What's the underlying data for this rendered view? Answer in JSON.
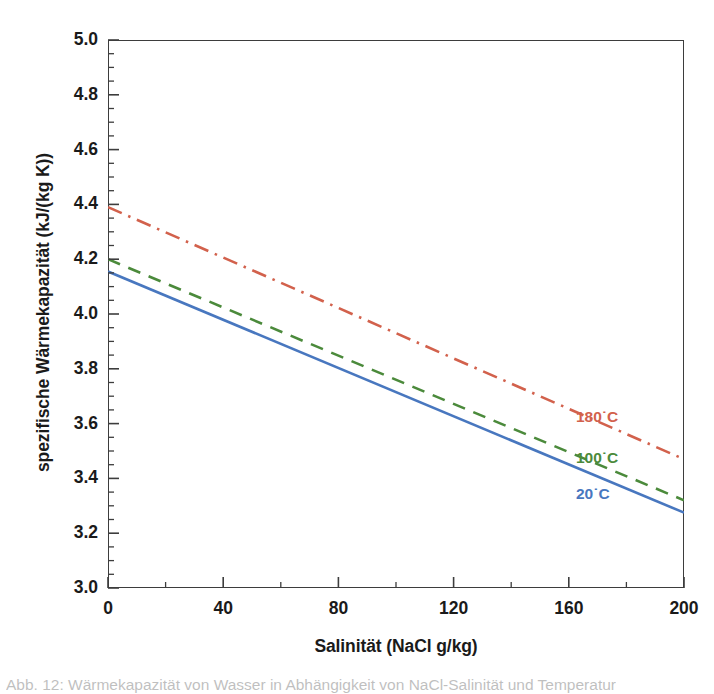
{
  "chart_data": {
    "type": "line",
    "title": "",
    "xlabel": "Salinität (NaCl g/kg)",
    "ylabel": "spezifische Wärmekapazität (kJ/(kg K))",
    "xlim": [
      0,
      200
    ],
    "ylim": [
      3.0,
      5.0
    ],
    "x_ticks": [
      0,
      40,
      80,
      120,
      160,
      200
    ],
    "x_tick_labels": [
      "0",
      "40",
      "80",
      "120",
      "160",
      "200"
    ],
    "x_minor_step": 20,
    "y_ticks": [
      3.0,
      3.2,
      3.4,
      3.6,
      3.8,
      4.0,
      4.2,
      4.4,
      4.6,
      4.8,
      5.0
    ],
    "y_tick_labels": [
      "3.0",
      "3.2",
      "3.4",
      "3.6",
      "3.8",
      "4.0",
      "4.2",
      "4.4",
      "4.6",
      "4.8",
      "5.0"
    ],
    "y_minor_step": 0.05,
    "grid": false,
    "legend_position": "inline-right",
    "x": [
      0,
      200
    ],
    "series": [
      {
        "name": "180°C",
        "label": "180˙C",
        "values": [
          4.39,
          3.47
        ],
        "color": "#d2614c",
        "style": "dashdot",
        "label_x": 200,
        "label_y": 3.62
      },
      {
        "name": "100°C",
        "label": "100˙C",
        "values": [
          4.2,
          3.32
        ],
        "color": "#4b8a3b",
        "style": "dashed",
        "label_x": 200,
        "label_y": 3.47
      },
      {
        "name": "20°C",
        "label": "20˙C",
        "values": [
          4.155,
          3.275
        ],
        "color": "#4877bf",
        "style": "solid",
        "label_x": 200,
        "label_y": 3.34
      }
    ]
  },
  "axis": {
    "y_title": "spezifische Wärmekapazität (kJ/(kg K))",
    "x_title": "Salinität (NaCl g/kg)"
  },
  "caption": {
    "text": "Abb. 12: Wärmekapazität von Wasser in Abhängigkeit von NaCl-Salinität und Temperatur"
  },
  "colors": {
    "axis": "#3d3d3d",
    "text": "#1a1a1a",
    "background": "#ffffff",
    "series_180": "#d2614c",
    "series_100": "#4b8a3b",
    "series_20": "#4877bf"
  }
}
